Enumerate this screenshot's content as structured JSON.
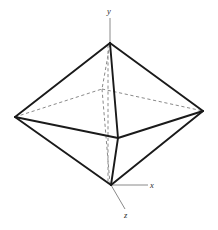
{
  "figure": {
    "name": "octahedron-with-axes",
    "background_color": "#ffffff",
    "width": 218,
    "height": 230,
    "edge_color": "#1a1a1a",
    "hidden_edge_color": "#8a8a8a",
    "axis_color": "#8a8a8a",
    "label_color": "#2b2b2b"
  },
  "axes": {
    "y": {
      "label": "y",
      "direction": "up",
      "line": {
        "x1": 110,
        "y1": 18,
        "x2": 110,
        "y2": 44
      }
    },
    "x": {
      "label": "x",
      "direction": "right",
      "line": {
        "x1": 111,
        "y1": 185,
        "x2": 148,
        "y2": 185
      }
    },
    "z": {
      "label": "z",
      "direction": "down-right",
      "line": {
        "x1": 111,
        "y1": 185,
        "x2": 125,
        "y2": 209
      }
    }
  },
  "solid": {
    "type": "octahedron",
    "vertices": [
      {
        "name": "apex-top",
        "id": "T",
        "x": 110,
        "y": 43,
        "hidden": false
      },
      {
        "name": "vertex-bottom-origin",
        "id": "B",
        "x": 111,
        "y": 185,
        "hidden": false
      },
      {
        "name": "vertex-left",
        "id": "L",
        "x": 15,
        "y": 117,
        "hidden": false
      },
      {
        "name": "vertex-right",
        "id": "R",
        "x": 203,
        "y": 111,
        "hidden": false
      },
      {
        "name": "vertex-front",
        "id": "F",
        "x": 118,
        "y": 138,
        "hidden": false
      },
      {
        "name": "vertex-back",
        "id": "K",
        "x": 102,
        "y": 89,
        "hidden": true
      }
    ],
    "visible_edges": [
      {
        "from": "T",
        "to": "L"
      },
      {
        "from": "T",
        "to": "R"
      },
      {
        "from": "T",
        "to": "F"
      },
      {
        "from": "L",
        "to": "F"
      },
      {
        "from": "R",
        "to": "F"
      },
      {
        "from": "L",
        "to": "B"
      },
      {
        "from": "R",
        "to": "B"
      },
      {
        "from": "F",
        "to": "B"
      }
    ],
    "hidden_edges": [
      {
        "from": "T",
        "to": "K"
      },
      {
        "from": "K",
        "to": "B"
      },
      {
        "from": "L",
        "to": "K"
      },
      {
        "from": "K",
        "to": "R"
      }
    ]
  }
}
